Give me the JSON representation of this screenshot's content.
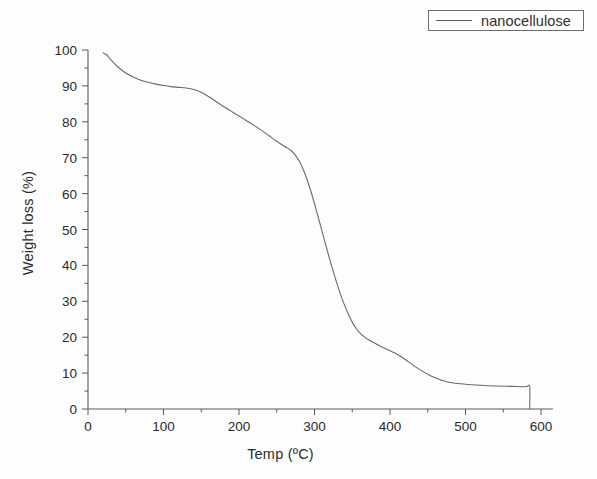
{
  "figure": {
    "background_color": "#fdfdfd",
    "axis_color": "#5a5a5a",
    "curve_color": "#6a6a6a",
    "text_color": "#2b2b2b"
  },
  "legend": {
    "entries": [
      {
        "label": "nanocellulose",
        "swatch": "line-swatch",
        "color": "#5a5a5a"
      }
    ]
  },
  "axes": {
    "x_title": "Temp (ºC)",
    "y_title": "Weight loss (%)",
    "x_ticks": [
      "0",
      "100",
      "200",
      "300",
      "400",
      "500",
      "600"
    ],
    "y_ticks": [
      "0",
      "10",
      "20",
      "30",
      "40",
      "50",
      "60",
      "70",
      "80",
      "90",
      "100"
    ]
  },
  "chart_data": {
    "type": "line",
    "title": "",
    "subtitle": "",
    "xlabel": "Temp (ºC)",
    "ylabel": "Weight loss (%)",
    "xlim": [
      0,
      600
    ],
    "ylim": [
      0,
      100
    ],
    "xticks": [
      0,
      100,
      200,
      300,
      400,
      500,
      600
    ],
    "yticks": [
      0,
      10,
      20,
      30,
      40,
      50,
      60,
      70,
      80,
      90,
      100
    ],
    "xtick_minor_step": 50,
    "ytick_minor_step": 5,
    "grid": false,
    "legend_position": "top-right",
    "legend_entries": [
      "nanocellulose"
    ],
    "annotations": [],
    "series": [
      {
        "name": "nanocellulose",
        "color": "#6a6a6a",
        "x": [
          20,
          25,
          30,
          40,
          50,
          60,
          70,
          80,
          90,
          100,
          110,
          120,
          130,
          140,
          150,
          160,
          170,
          180,
          190,
          200,
          210,
          220,
          230,
          240,
          250,
          260,
          265,
          270,
          275,
          280,
          285,
          290,
          295,
          300,
          305,
          310,
          315,
          320,
          325,
          330,
          335,
          340,
          345,
          350,
          355,
          360,
          365,
          370,
          380,
          390,
          400,
          410,
          420,
          430,
          440,
          450,
          460,
          470,
          480,
          500,
          520,
          540,
          560,
          580,
          585,
          585
        ],
        "y": [
          99.2,
          98.6,
          97.3,
          95.2,
          93.6,
          92.5,
          91.6,
          91.0,
          90.5,
          90.1,
          89.8,
          89.6,
          89.4,
          89.0,
          88.2,
          87.0,
          85.6,
          84.2,
          82.9,
          81.6,
          80.3,
          79.0,
          77.6,
          76.1,
          74.6,
          73.2,
          72.6,
          71.8,
          70.6,
          69.0,
          66.8,
          64.0,
          60.8,
          57.2,
          53.4,
          49.5,
          45.6,
          41.8,
          38.2,
          34.8,
          31.6,
          28.8,
          26.3,
          24.2,
          22.5,
          21.2,
          20.3,
          19.5,
          18.3,
          17.2,
          16.2,
          15.2,
          13.8,
          12.3,
          10.9,
          9.7,
          8.7,
          7.9,
          7.4,
          6.9,
          6.6,
          6.4,
          6.3,
          6.2,
          6.2,
          0.0
        ]
      }
    ]
  }
}
